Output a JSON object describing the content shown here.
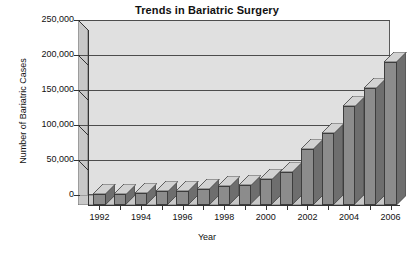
{
  "chart_data": {
    "type": "bar",
    "title": "Trends in Bariatric Surgery",
    "xlabel": "Year",
    "ylabel": "Number of Bariatric Cases",
    "categories": [
      "1992",
      "1993",
      "1994",
      "1995",
      "1996",
      "1997",
      "1998",
      "1999",
      "2000",
      "2001",
      "2002",
      "2003",
      "2004",
      "2005",
      "2006"
    ],
    "values": [
      16000,
      16000,
      17000,
      20000,
      20000,
      23000,
      27000,
      28000,
      37000,
      47000,
      80000,
      103000,
      141000,
      167000,
      205000
    ],
    "ylim": [
      0,
      250000
    ],
    "ytick_labels": [
      "0",
      "50,000",
      "100,000",
      "150,000",
      "200,000",
      "250,000"
    ],
    "ytick_values": [
      0,
      50000,
      100000,
      150000,
      200000,
      250000
    ],
    "xtick_labels": [
      "1992",
      "1994",
      "1996",
      "1998",
      "2000",
      "2002",
      "2004",
      "2006"
    ],
    "xtick_categories": [
      "1992",
      "1994",
      "1996",
      "1998",
      "2000",
      "2002",
      "2004",
      "2006"
    ],
    "grid": true,
    "legend": "none",
    "style_3d": true,
    "colors": {
      "bar_front": "#8c8c8c",
      "bar_top": "#d2d2d2",
      "bar_side": "#6e6e6e",
      "plot_background": "#e0e0e0",
      "gridline": "#4d4d4d",
      "axis": "#333333",
      "text": "#111111",
      "figure_background": "#ffffff"
    }
  }
}
